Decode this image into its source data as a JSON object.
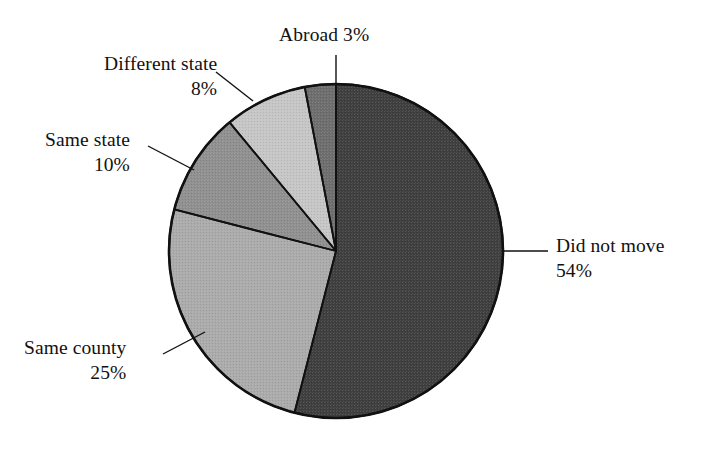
{
  "figure": {
    "background_color": "#ffffff",
    "text_color": "#111111",
    "outline_color": "#111111"
  },
  "chart_data": {
    "type": "pie",
    "title": "",
    "subtitle": "",
    "xlabel": "",
    "ylabel": "",
    "legend_position": "none",
    "grid": false,
    "start_angle_deg": 0,
    "direction": "clockwise",
    "labels": [
      "Did not move",
      "Same county",
      "Same state",
      "Different state",
      "Abroad"
    ],
    "values": [
      54,
      25,
      10,
      8,
      3
    ],
    "value_suffix": "%",
    "colors": [
      "#3f3f3f",
      "#ababab",
      "#909090",
      "#c6c6c6",
      "#6e6e6e"
    ],
    "slices": [
      {
        "label": "Did not move",
        "value": 54,
        "value_text": "54%",
        "color": "#3f3f3f",
        "start_deg": 0,
        "end_deg": 194.4
      },
      {
        "label": "Same county",
        "value": 25,
        "value_text": "25%",
        "color": "#ababab",
        "start_deg": 194.4,
        "end_deg": 284.4
      },
      {
        "label": "Same state",
        "value": 10,
        "value_text": "10%",
        "color": "#909090",
        "start_deg": 284.4,
        "end_deg": 320.4
      },
      {
        "label": "Different state",
        "value": 8,
        "value_text": "8%",
        "color": "#c6c6c6",
        "start_deg": 320.4,
        "end_deg": 349.2
      },
      {
        "label": "Abroad",
        "value": 3,
        "value_text": "3%",
        "color": "#6e6e6e",
        "start_deg": 349.2,
        "end_deg": 360
      }
    ]
  },
  "labels": {
    "did_not_move": {
      "name": "Did not move",
      "value": "54%"
    },
    "same_county": {
      "name": "Same county",
      "value": "25%"
    },
    "same_state": {
      "name": "Same state",
      "value": "10%"
    },
    "diff_state": {
      "name": "Different state",
      "value": "8%"
    },
    "abroad": {
      "name": "Abroad 3%",
      "value": ""
    }
  }
}
